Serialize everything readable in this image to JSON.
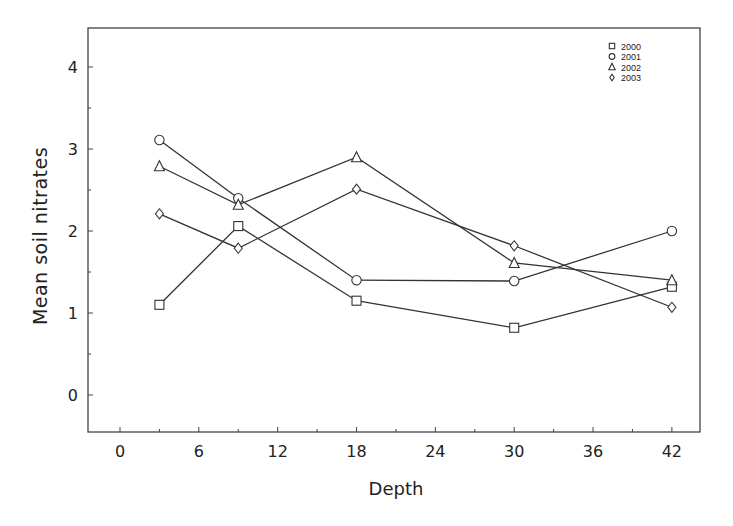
{
  "chart_data": {
    "type": "line",
    "title": "",
    "xlabel": "Depth",
    "ylabel": "Mean soil nitrates",
    "x": [
      3,
      9,
      18,
      30,
      42
    ],
    "xticks": [
      0,
      6,
      12,
      18,
      24,
      30,
      36,
      42
    ],
    "xticks_minor": [
      3,
      9,
      15,
      21,
      27,
      33,
      39
    ],
    "yticks": [
      0,
      1,
      2,
      3,
      4
    ],
    "yticks_minor": [
      0.5,
      1.5,
      2.5,
      3.5
    ],
    "xlim": [
      -0.6,
      44.1
    ],
    "ylim": [
      -0.45,
      4.48
    ],
    "grid": false,
    "legend_position": "top-right",
    "series": [
      {
        "name": "2000",
        "marker": "square",
        "values": [
          1.1,
          2.06,
          1.15,
          0.82,
          1.32
        ]
      },
      {
        "name": "2001",
        "marker": "circle",
        "values": [
          3.11,
          2.4,
          1.4,
          1.39,
          2.0
        ]
      },
      {
        "name": "2002",
        "marker": "triangle",
        "values": [
          2.79,
          2.32,
          2.9,
          1.61,
          1.4
        ]
      },
      {
        "name": "2003",
        "marker": "diamond",
        "values": [
          2.21,
          1.79,
          2.51,
          1.82,
          1.07
        ]
      }
    ]
  },
  "style": {
    "line_color": "#333333",
    "axis_color": "#444444",
    "background": "#ffffff"
  }
}
